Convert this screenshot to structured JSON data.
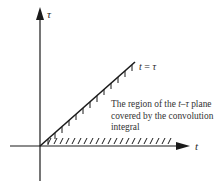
{
  "diagram": {
    "axes": {
      "vertical_label": "τ",
      "horizontal_label": "t"
    },
    "line_label": {
      "lhs": "t",
      "eq": " = ",
      "rhs": "τ"
    },
    "caption": {
      "line1_pre": "The region of the ",
      "line1_var": "t–τ",
      "line1_post": " plane",
      "line2": "covered by the convolution",
      "line3": "integral"
    },
    "colors": {
      "ink": "#1a1a1a",
      "text": "#333333",
      "background": "#ffffff"
    }
  }
}
